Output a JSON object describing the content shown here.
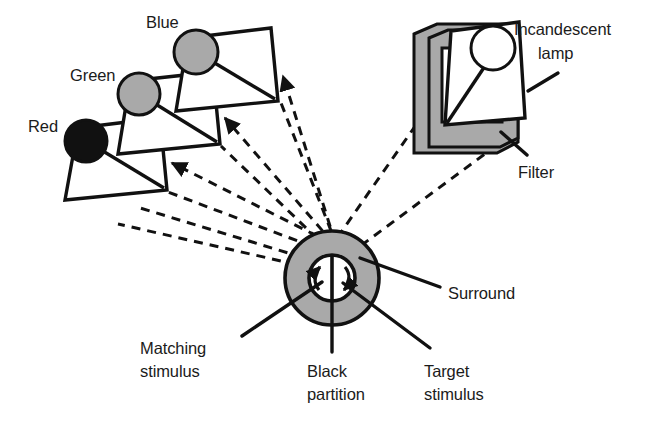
{
  "figure": {
    "type": "apparatus-diagram",
    "width": 657,
    "height": 427,
    "background_color": "#ffffff",
    "line_color": "#111111",
    "shade_gray": "#a9a9a9",
    "shade_gray_dark": "#8f8f8f",
    "black_fill": "#111111",
    "white_fill": "#ffffff"
  },
  "labels": {
    "red": "Red",
    "green": "Green",
    "blue": "Blue",
    "incandescent_lamp_line1": "Incandescent",
    "incandescent_lamp_line2": "lamp",
    "filter": "Filter",
    "surround": "Surround",
    "matching_stimulus_line1": "Matching",
    "matching_stimulus_line2": "stimulus",
    "black_partition_line1": "Black",
    "black_partition_line2": "partition",
    "target_stimulus_line1": "Target",
    "target_stimulus_line2": "stimulus"
  },
  "projectors": [
    {
      "name": "red-projector",
      "label": "Red",
      "lamp_fill": "#111111",
      "lamp_cx": 86,
      "lamp_cy": 141,
      "lamp_r": 21,
      "body": "78,128 160,118 167,190 65,200",
      "label_x": 28,
      "label_y": 132
    },
    {
      "name": "green-projector",
      "label": "Green",
      "lamp_fill": "#a9a9a9",
      "lamp_cx": 139,
      "lamp_cy": 94,
      "lamp_r": 21,
      "body": "130,81 213,72 220,144 118,154",
      "label_x": 70,
      "label_y": 81
    },
    {
      "name": "blue-projector",
      "label": "Blue",
      "lamp_fill": "#a9a9a9",
      "lamp_cx": 196,
      "lamp_cy": 52,
      "lamp_r": 22,
      "body": "188,38 271,28 278,101 176,111",
      "label_x": 146,
      "label_y": 28
    }
  ],
  "lamp_assembly": {
    "name": "incandescent-lamp-with-filter",
    "lamp_cx": 493,
    "lamp_cy": 48,
    "lamp_r": 22,
    "lamp_fill": "#ffffff",
    "filter_fill": "#a9a9a9"
  },
  "stimulus_disc": {
    "name": "stimulus-disc",
    "center_x": 332,
    "center_y": 278,
    "outer_radius": 47,
    "inner_radius": 23,
    "surround_fill": "#a9a9a9",
    "field_fill": "#ffffff",
    "partition_color": "#111111"
  },
  "ray_count": {
    "to_projectors": 6,
    "from_lamp": 2
  }
}
